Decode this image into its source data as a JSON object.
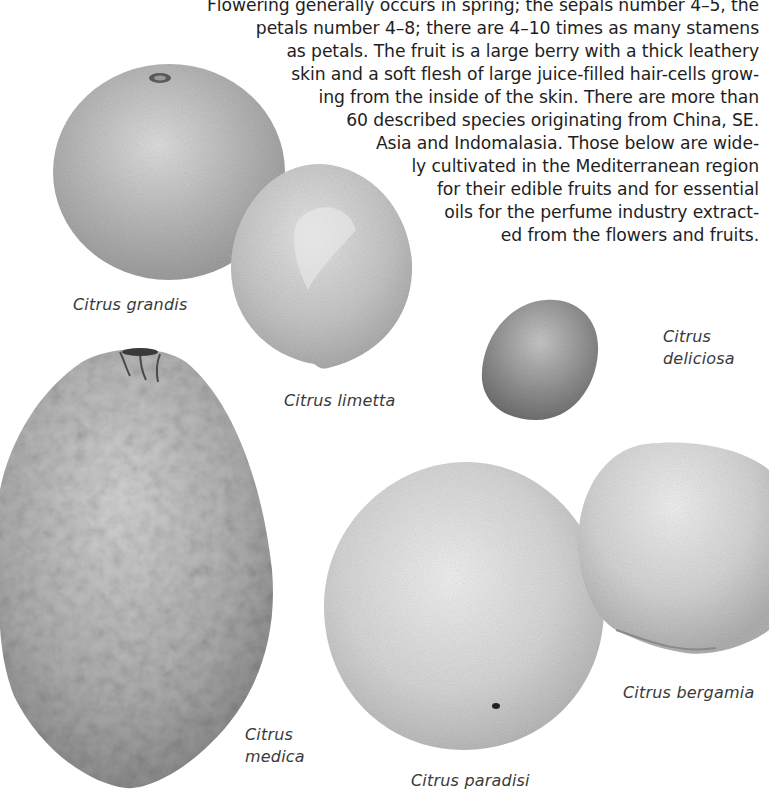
{
  "page": {
    "body_text_lines": [
      "Flowering generally occurs in spring; the sepals number 4–5, the",
      "petals number 4–8; there are 4–10 times as many stamens",
      "as petals. The fruit is a large berry with a thick leathery",
      "skin and a soft flesh of large juice-filled hair-cells grow-",
      "ing from the inside of the skin. There are more than",
      "60 described species originating from China, SE.",
      "Asia and Indomalasia. Those below are wide-",
      "ly cultivated in the Mediterranean region",
      "for their edible fruits and for essential",
      "oils for the perfume industry extract-",
      "ed from the flowers and fruits."
    ]
  },
  "illustrations": [
    {
      "id": "grandis",
      "caption": "Citrus grandis",
      "caption_lines": [
        "Citrus grandis"
      ],
      "tone": "#b4b4b4"
    },
    {
      "id": "limetta",
      "caption": "Citrus limetta",
      "caption_lines": [
        "Citrus limetta"
      ],
      "tone": "#c2c2c2"
    },
    {
      "id": "deliciosa",
      "caption": "Citrus deliciosa",
      "caption_lines": [
        "Citrus",
        "deliciosa"
      ],
      "tone": "#8f8f8f"
    },
    {
      "id": "medica",
      "caption": "Citrus medica",
      "caption_lines": [
        "Citrus",
        "medica"
      ],
      "tone": "#a9a9a9"
    },
    {
      "id": "paradisi",
      "caption": "Citrus paradisi",
      "caption_lines": [
        "Citrus paradisi"
      ],
      "tone": "#d2d2d2"
    },
    {
      "id": "bergamia",
      "caption": "Citrus bergamia",
      "caption_lines": [
        "Citrus bergamia"
      ],
      "tone": "#d0d0d0"
    }
  ]
}
